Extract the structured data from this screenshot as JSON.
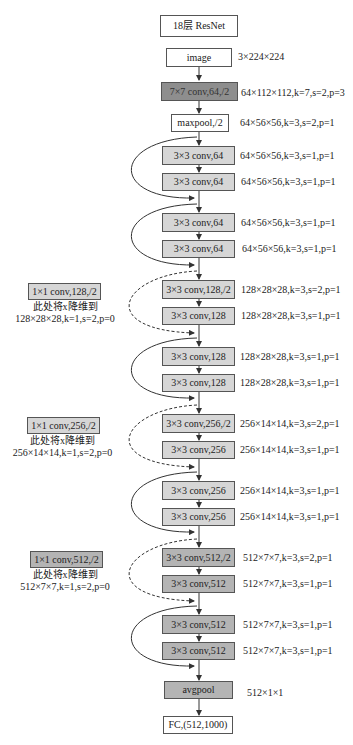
{
  "title": "18层 ResNet",
  "layers": [
    {
      "label": "image",
      "shape": "3×224×224",
      "style": "white"
    },
    {
      "label": "7×7 conv,64,/2",
      "shape": "64×112×112,k=7,s=2,p=3",
      "style": "dark"
    },
    {
      "label": "maxpool,/2",
      "shape": "64×56×56,k=3,s=2,p=1",
      "style": "white"
    },
    {
      "label": "3×3 conv,64",
      "shape": "64×56×56,k=3,s=1,p=1",
      "style": "light"
    },
    {
      "label": "3×3 conv,64",
      "shape": "64×56×56,k=3,s=1,p=1",
      "style": "light"
    },
    {
      "label": "3×3 conv,64",
      "shape": "64×56×56,k=3,s=1,p=1",
      "style": "light"
    },
    {
      "label": "3×3 conv,64",
      "shape": "64×56×56,k=3,s=1,p=1",
      "style": "light"
    },
    {
      "label": "3×3 conv,128,/2",
      "shape": "128×28×28,k=3,s=2,p=1",
      "style": "light"
    },
    {
      "label": "3×3 conv,128",
      "shape": "128×28×28,k=3,s=1,p=1",
      "style": "light"
    },
    {
      "label": "3×3 conv,128",
      "shape": "128×28×28,k=3,s=1,p=1",
      "style": "light"
    },
    {
      "label": "3×3 conv,128",
      "shape": "128×28×28,k=3,s=1,p=1",
      "style": "light"
    },
    {
      "label": "3×3 conv,256,/2",
      "shape": "256×14×14,k=3,s=2,p=1",
      "style": "light"
    },
    {
      "label": "3×3 conv,256",
      "shape": "256×14×14,k=3,s=1,p=1",
      "style": "light"
    },
    {
      "label": "3×3 conv,256",
      "shape": "256×14×14,k=3,s=1,p=1",
      "style": "light"
    },
    {
      "label": "3×3 conv,256",
      "shape": "256×14×14,k=3,s=1,p=1",
      "style": "light"
    },
    {
      "label": "3×3 conv,512,/2",
      "shape": "512×7×7,k=3,s=2,p=1",
      "style": "mid"
    },
    {
      "label": "3×3 conv,512",
      "shape": "512×7×7,k=3,s=1,p=1",
      "style": "mid"
    },
    {
      "label": "3×3 conv,512",
      "shape": "512×7×7,k=3,s=1,p=1",
      "style": "mid"
    },
    {
      "label": "3×3 conv,512",
      "shape": "512×7×7,k=3,s=1,p=1",
      "style": "mid"
    },
    {
      "label": "avgpool",
      "shape": "512×1×1",
      "style": "mid"
    },
    {
      "label": "FC,(512,1000)",
      "shape": "",
      "style": "white"
    }
  ],
  "shortcuts": [
    {
      "label": "1×1 conv,128,/2",
      "note1": "此处将x降维到",
      "note2": "128×28×28,k=1,s=2,p=0",
      "style": "light"
    },
    {
      "label": "1×1 conv,256,/2",
      "note1": "此处将x降维到",
      "note2": "256×14×14,k=1,s=2,p=0",
      "style": "light"
    },
    {
      "label": "1×1 conv,512,/2",
      "note1": "此处将x降维到",
      "note2": "512×7×7,k=1,s=2,p=0",
      "style": "mid"
    }
  ]
}
